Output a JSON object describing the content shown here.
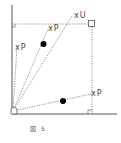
{
  "figure": {
    "caption_label": "図",
    "caption_number": "5",
    "colors": {
      "axis": "#555555",
      "dashed": "#777777",
      "dot": "#000000",
      "text": "#444444"
    }
  },
  "points": {
    "u": {
      "mark": "x",
      "label": "U"
    },
    "p1": {
      "mark": "x",
      "label": "P"
    },
    "p2": {
      "mark": "x",
      "label": "P"
    },
    "p3": {
      "mark": "x",
      "label": "P"
    }
  }
}
